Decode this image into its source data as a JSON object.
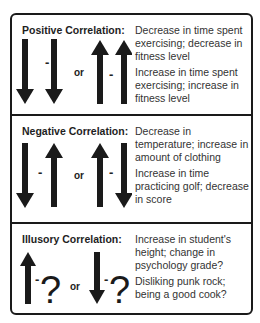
{
  "sections": [
    {
      "title": "Positive Correlation:",
      "pattern": [
        "arrow-down",
        "arrow-down",
        "or",
        "arrow-up",
        "arrow-up"
      ],
      "connector": "-",
      "or_label": "or",
      "examples": [
        "Decrease in time spent exercising; decrease in fitness level",
        "Increase in time spent exercising; increase in fitness level"
      ]
    },
    {
      "title": "Negative Correlation:",
      "pattern": [
        "arrow-down",
        "arrow-up",
        "or",
        "arrow-up",
        "arrow-down"
      ],
      "connector": "-",
      "or_label": "or",
      "examples": [
        "Decrease in temperature; increase in amount of clothing",
        "Increase in time practicing golf; decrease in score"
      ]
    },
    {
      "title": "Illusory Correlation:",
      "pattern": [
        "arrow-up",
        "question",
        "or",
        "arrow-down",
        "question"
      ],
      "connector": "-",
      "or_label": "or",
      "question_mark": "?",
      "examples": [
        "Increase in student's height; change in psychology grade?",
        "Disliking punk rock; being a good cook?"
      ]
    }
  ]
}
